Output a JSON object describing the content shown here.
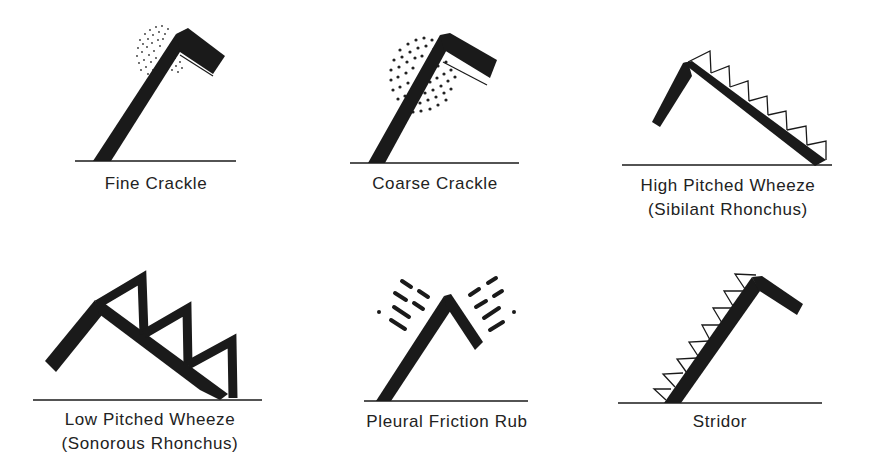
{
  "diagram": {
    "panels": [
      {
        "id": "fine-crackle",
        "label": "Fine Crackle",
        "sublabel": ""
      },
      {
        "id": "coarse-crackle",
        "label": "Coarse Crackle",
        "sublabel": ""
      },
      {
        "id": "high-pitched-wheeze",
        "label": "High Pitched Wheeze",
        "sublabel": "(Sibilant Rhonchus)"
      },
      {
        "id": "low-pitched-wheeze",
        "label": "Low Pitched Wheeze",
        "sublabel": "(Sonorous Rhonchus)"
      },
      {
        "id": "pleural-friction-rub",
        "label": "Pleural Friction Rub",
        "sublabel": ""
      },
      {
        "id": "stridor",
        "label": "Stridor",
        "sublabel": ""
      }
    ],
    "colors": {
      "ink": "#1a1a1a",
      "background": "#ffffff"
    }
  }
}
